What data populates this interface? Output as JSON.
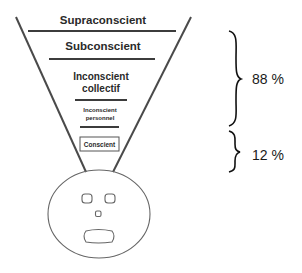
{
  "diagram": {
    "levels": [
      {
        "id": "supraconscient",
        "label_lines": [
          "Supraconscient"
        ]
      },
      {
        "id": "subconscient",
        "label_lines": [
          "Subconscient"
        ]
      },
      {
        "id": "inconscient-collectif",
        "label_lines": [
          "Inconscient",
          "collectif"
        ]
      },
      {
        "id": "inconscient-personnel",
        "label_lines": [
          "Inconscient",
          "personnel"
        ]
      },
      {
        "id": "conscient",
        "label_lines": [
          "Conscient"
        ]
      }
    ],
    "brackets": [
      {
        "id": "unconscious-share",
        "value": "88 %"
      },
      {
        "id": "conscious-share",
        "value": "12 %"
      }
    ],
    "colors": {
      "line": "#3c3c3c",
      "text": "#2a2a2a",
      "face": "#666666"
    }
  }
}
